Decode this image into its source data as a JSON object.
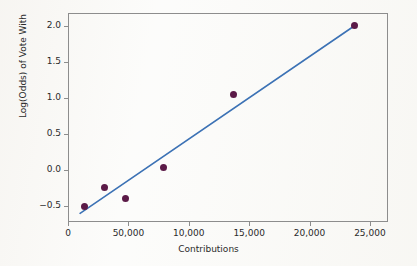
{
  "chart_data": {
    "type": "scatter",
    "title": "",
    "xlabel": "Contributions",
    "ylabel": "Log(Odds) of Vote With",
    "xlim": [
      0,
      26500
    ],
    "ylim": [
      -0.72,
      2.18
    ],
    "grid": false,
    "legend": "none",
    "x_ticks": [
      {
        "value": 0,
        "label": "0"
      },
      {
        "value": 5000,
        "label": "50,000"
      },
      {
        "value": 10000,
        "label": "10,000"
      },
      {
        "value": 15000,
        "label": "15,000"
      },
      {
        "value": 20000,
        "label": "20,000"
      },
      {
        "value": 25000,
        "label": "25,000"
      }
    ],
    "y_ticks": [
      {
        "value": 2.0,
        "label": "2.0"
      },
      {
        "value": 1.5,
        "label": "1.5"
      },
      {
        "value": 1.0,
        "label": "1.0"
      },
      {
        "value": 0.5,
        "label": "0.5"
      },
      {
        "value": 0.0,
        "label": "0.0"
      },
      {
        "value": -0.5,
        "label": "−0.5"
      }
    ],
    "series": [
      {
        "name": "observations",
        "marker": "filled-circle",
        "color": "#5b1a47",
        "points": [
          {
            "x": 1400,
            "y": -0.5
          },
          {
            "x": 3000,
            "y": -0.24
          },
          {
            "x": 4800,
            "y": -0.39
          },
          {
            "x": 7900,
            "y": 0.03
          },
          {
            "x": 13700,
            "y": 1.05
          },
          {
            "x": 23700,
            "y": 2.0
          }
        ]
      }
    ],
    "fit_line": {
      "name": "linear-fit",
      "color": "#3c72b5",
      "x_start": 1000,
      "y_start": -0.6,
      "x_end": 23700,
      "y_end": 2.0
    },
    "colors": {
      "marker": "#5b1a47",
      "fit_line": "#3c72b5",
      "axis": "#8d8d8d",
      "text": "#2b2b2b",
      "background": "#fbfbf9"
    }
  }
}
